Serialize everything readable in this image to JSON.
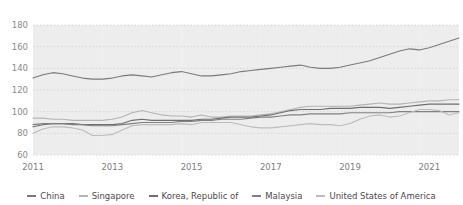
{
  "chart_data": {
    "type": "line",
    "title": "",
    "subtitle": "",
    "xlabel": "",
    "ylabel": "",
    "xlim": [
      2011,
      2021.75
    ],
    "ylim": [
      60,
      180
    ],
    "yticks": [
      60,
      80,
      100,
      120,
      140,
      160,
      180
    ],
    "xticks": [
      2011,
      2013,
      2015,
      2017,
      2019,
      2021
    ],
    "grid": "horizontal-dotted",
    "band_shading": "alternating-year-pairs",
    "legend_position": "bottom-center",
    "x": [
      2011,
      2011.25,
      2011.5,
      2011.75,
      2012,
      2012.25,
      2012.5,
      2012.75,
      2013,
      2013.25,
      2013.5,
      2013.75,
      2014,
      2014.25,
      2014.5,
      2014.75,
      2015,
      2015.25,
      2015.5,
      2015.75,
      2016,
      2016.25,
      2016.5,
      2016.75,
      2017,
      2017.25,
      2017.5,
      2017.75,
      2018,
      2018.25,
      2018.5,
      2018.75,
      2019,
      2019.25,
      2019.5,
      2019.75,
      2020,
      2020.25,
      2020.5,
      2020.75,
      2021,
      2021.25,
      2021.5,
      2021.75
    ],
    "series": [
      {
        "name": "China",
        "color": "#7a7a7a",
        "values": [
          131,
          134,
          136,
          135,
          133,
          131,
          130,
          130,
          131,
          133,
          134,
          133,
          132,
          134,
          136,
          137,
          135,
          133,
          133,
          134,
          135,
          137,
          138,
          139,
          140,
          141,
          142,
          143,
          141,
          140,
          140,
          141,
          143,
          145,
          147,
          150,
          153,
          156,
          158,
          157,
          159,
          162,
          165,
          168
        ]
      },
      {
        "name": "Singapore",
        "color": "#b4b4b4",
        "values": [
          94,
          94,
          93,
          93,
          92,
          92,
          92,
          92,
          93,
          95,
          99,
          101,
          99,
          97,
          96,
          96,
          95,
          97,
          95,
          95,
          96,
          96,
          96,
          97,
          98,
          100,
          102,
          104,
          105,
          105,
          105,
          105,
          105,
          106,
          107,
          108,
          107,
          107,
          108,
          109,
          110,
          110,
          111,
          111
        ]
      },
      {
        "name": "Korea, Republic of",
        "color": "#6e6e6e",
        "values": [
          86,
          88,
          89,
          89,
          89,
          88,
          88,
          88,
          88,
          89,
          92,
          93,
          92,
          92,
          92,
          92,
          92,
          93,
          93,
          94,
          95,
          95,
          95,
          96,
          97,
          99,
          101,
          102,
          102,
          102,
          103,
          103,
          103,
          104,
          104,
          104,
          103,
          104,
          105,
          106,
          107,
          107,
          107,
          107
        ]
      },
      {
        "name": "Malaysia",
        "color": "#808080",
        "values": [
          88,
          89,
          89,
          89,
          88,
          88,
          87,
          87,
          87,
          88,
          89,
          90,
          90,
          90,
          90,
          91,
          91,
          92,
          92,
          93,
          93,
          93,
          94,
          95,
          95,
          96,
          97,
          97,
          98,
          98,
          98,
          98,
          99,
          99,
          99,
          99,
          99,
          100,
          100,
          100,
          100,
          100,
          100,
          100
        ]
      },
      {
        "name": "United States of America",
        "color": "#bcbcbc",
        "values": [
          80,
          84,
          86,
          86,
          85,
          83,
          78,
          78,
          79,
          83,
          87,
          88,
          88,
          88,
          88,
          89,
          88,
          90,
          90,
          90,
          90,
          88,
          86,
          85,
          85,
          86,
          87,
          88,
          89,
          88,
          88,
          87,
          89,
          93,
          96,
          97,
          95,
          96,
          99,
          102,
          102,
          101,
          97,
          99
        ]
      }
    ]
  },
  "axis": {
    "ytick_labels": [
      "180",
      "160",
      "140",
      "120",
      "100",
      "80",
      "60"
    ],
    "xtick_labels": [
      "2011",
      "2013",
      "2015",
      "2017",
      "2019",
      "2021"
    ]
  },
  "legend": {
    "items": [
      {
        "label": "China",
        "color": "#7a7a7a"
      },
      {
        "label": "Singapore",
        "color": "#b4b4b4"
      },
      {
        "label": "Korea, Republic of",
        "color": "#6e6e6e"
      },
      {
        "label": "Malaysia",
        "color": "#808080"
      },
      {
        "label": "United States of America",
        "color": "#bcbcbc"
      }
    ]
  },
  "style": {
    "band_color": "#ededed",
    "grid_color": "#cfcfcf",
    "background": "#ffffff"
  }
}
